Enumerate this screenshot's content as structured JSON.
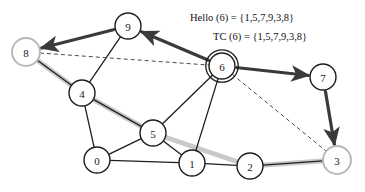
{
  "diagram": {
    "colors": {
      "edge": "#1d1d1d",
      "node_stroke": "#1d1d1d",
      "node_fill": "#ffffff",
      "highlight_node_stroke": "#b9b9b9",
      "mpr_path": "#c9c9c9",
      "arrow_path": "#3a3a3a",
      "dashed": "#4a4a4a",
      "text": "#111111"
    },
    "annotations": [
      {
        "id": "hello",
        "text": "Hello (6) = {1,5,7,9,3,8}",
        "x": 190,
        "y": 21
      },
      {
        "id": "tc",
        "text": "TC (6) = {1,5,7,9,3,8}",
        "x": 213,
        "y": 40
      }
    ],
    "nodes": [
      {
        "id": "8",
        "label": "8",
        "x": 26,
        "y": 52,
        "r": 14,
        "style": "gray-ring"
      },
      {
        "id": "9",
        "label": "9",
        "x": 128,
        "y": 26,
        "r": 13,
        "style": "plain"
      },
      {
        "id": "6",
        "label": "6",
        "x": 222,
        "y": 66,
        "r": 13,
        "style": "double-ring"
      },
      {
        "id": "7",
        "label": "7",
        "x": 323,
        "y": 77,
        "r": 13,
        "style": "plain"
      },
      {
        "id": "4",
        "label": "4",
        "x": 82,
        "y": 93,
        "r": 13,
        "style": "plain"
      },
      {
        "id": "5",
        "label": "5",
        "x": 153,
        "y": 133,
        "r": 13,
        "style": "plain"
      },
      {
        "id": "0",
        "label": "0",
        "x": 97,
        "y": 160,
        "r": 13,
        "style": "plain"
      },
      {
        "id": "1",
        "label": "1",
        "x": 192,
        "y": 163,
        "r": 13,
        "style": "plain"
      },
      {
        "id": "2",
        "label": "2",
        "x": 250,
        "y": 166,
        "r": 13,
        "style": "plain"
      },
      {
        "id": "3",
        "label": "3",
        "x": 337,
        "y": 160,
        "r": 14,
        "style": "gray-ring"
      }
    ],
    "edges": [
      {
        "from": "8",
        "to": "9",
        "kind": "solid"
      },
      {
        "from": "8",
        "to": "4",
        "kind": "solid"
      },
      {
        "from": "9",
        "to": "4",
        "kind": "solid"
      },
      {
        "from": "9",
        "to": "6",
        "kind": "solid"
      },
      {
        "from": "6",
        "to": "7",
        "kind": "solid"
      },
      {
        "from": "6",
        "to": "5",
        "kind": "solid"
      },
      {
        "from": "6",
        "to": "1",
        "kind": "solid"
      },
      {
        "from": "4",
        "to": "0",
        "kind": "solid"
      },
      {
        "from": "4",
        "to": "5",
        "kind": "solid"
      },
      {
        "from": "5",
        "to": "0",
        "kind": "solid"
      },
      {
        "from": "5",
        "to": "1",
        "kind": "solid"
      },
      {
        "from": "0",
        "to": "1",
        "kind": "solid"
      },
      {
        "from": "1",
        "to": "2",
        "kind": "solid"
      },
      {
        "from": "2",
        "to": "3",
        "kind": "solid"
      },
      {
        "from": "7",
        "to": "3",
        "kind": "solid"
      },
      {
        "from": "8",
        "to": "6",
        "kind": "dashed"
      },
      {
        "from": "6",
        "to": "3",
        "kind": "dashed"
      }
    ],
    "mpr_path": {
      "label": "mpr-relay-path",
      "waypoints": [
        "8",
        "4",
        "5",
        "2",
        "3"
      ]
    },
    "flood_arrows": [
      {
        "from": "9",
        "to": "8",
        "label": "arrow-9-to-8"
      },
      {
        "from": "6",
        "to": "9",
        "label": "arrow-6-to-9"
      },
      {
        "from": "6",
        "to": "7",
        "label": "arrow-6-to-7"
      },
      {
        "from": "7",
        "to": "3",
        "label": "arrow-7-to-3"
      }
    ]
  }
}
